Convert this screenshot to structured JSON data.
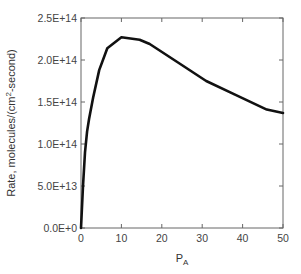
{
  "chart_data": {
    "type": "line",
    "title": "",
    "xlabel": "P",
    "xlabel_subscript": "A",
    "ylabel": "Rate, molecules/(cm",
    "ylabel_superscript": "2",
    "ylabel_suffix": "-second)",
    "xlim": [
      0,
      50
    ],
    "ylim": [
      0,
      250000000000000.0
    ],
    "x_ticks": [
      0,
      10,
      20,
      30,
      40,
      50
    ],
    "x_tick_labels": [
      "0",
      "10",
      "20",
      "30",
      "40",
      "50"
    ],
    "y_ticks": [
      0,
      50000000000000.0,
      100000000000000.0,
      150000000000000.0,
      200000000000000.0,
      250000000000000.0
    ],
    "y_tick_labels": [
      "0.0E+0",
      "5.0E+13",
      "1.0E+14",
      "1.5E+14",
      "2.0E+14",
      "2.5E+14"
    ],
    "grid": false,
    "legend": null,
    "series": [
      {
        "name": "Rate",
        "color": "#111111",
        "x": [
          0,
          0.5,
          1,
          1.5,
          2,
          3,
          4.5,
          6.5,
          10,
          14.5,
          17,
          24,
          31,
          38,
          46,
          50
        ],
        "y": [
          0,
          50000000000000.0,
          90000000000000.0,
          115000000000000.0,
          130000000000000.0,
          155000000000000.0,
          188000000000000.0,
          214000000000000.0,
          227000000000000.0,
          224000000000000.0,
          219000000000000.0,
          197000000000000.0,
          175000000000000.0,
          159000000000000.0,
          141000000000000.0,
          137000000000000.0
        ]
      }
    ]
  }
}
